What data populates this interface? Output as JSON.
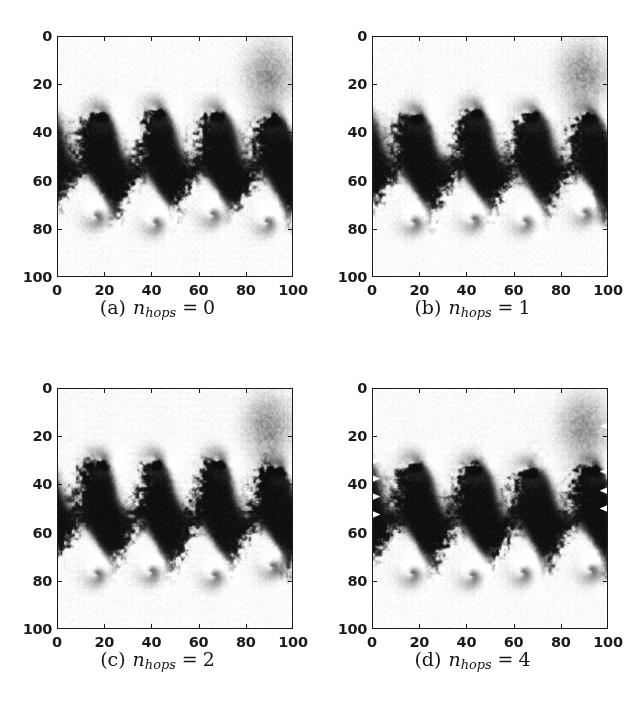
{
  "figure": {
    "type": "image-grid",
    "rows": 2,
    "cols": 2,
    "background_color": "#ffffff",
    "foreground_color": "#1a1a1a",
    "colormap": "grayscale"
  },
  "axis": {
    "x_ticks": [
      "0",
      "20",
      "40",
      "60",
      "80",
      "100"
    ],
    "y_ticks": [
      "0",
      "20",
      "40",
      "60",
      "80",
      "100"
    ],
    "x_tick_values": [
      0,
      20,
      40,
      60,
      80,
      100
    ],
    "y_tick_values": [
      0,
      20,
      40,
      60,
      80,
      100
    ],
    "xlim": [
      0,
      100
    ],
    "ylim": [
      0,
      100
    ],
    "y_inverted": true,
    "tick_direction": "in",
    "xlabel": "",
    "ylabel": ""
  },
  "panels": [
    {
      "id": "a",
      "caption_label": "(a)",
      "caption_var": "n",
      "caption_sub": "hops",
      "caption_eq": "=",
      "caption_value": "0",
      "caption_full": "(a) n_hops = 0",
      "seed": 10,
      "edge_markers": false
    },
    {
      "id": "b",
      "caption_label": "(b)",
      "caption_var": "n",
      "caption_sub": "hops",
      "caption_eq": "=",
      "caption_value": "1",
      "caption_full": "(b) n_hops = 1",
      "seed": 23,
      "edge_markers": false
    },
    {
      "id": "c",
      "caption_label": "(c)",
      "caption_var": "n",
      "caption_sub": "hops",
      "caption_eq": "=",
      "caption_value": "2",
      "caption_full": "(c) n_hops = 2",
      "seed": 41,
      "edge_markers": false
    },
    {
      "id": "d",
      "caption_label": "(d)",
      "caption_var": "n",
      "caption_sub": "hops",
      "caption_eq": "=",
      "caption_value": "4",
      "caption_full": "(d) n_hops = 4",
      "seed": 57,
      "edge_markers": true
    }
  ],
  "chart_data": {
    "type": "heatmap",
    "title": "",
    "xlabel": "",
    "ylabel": "",
    "xlim": [
      0,
      100
    ],
    "ylim": [
      0,
      100
    ],
    "grid": false,
    "legend": "none",
    "colormap": "gray",
    "value_range": [
      0,
      1
    ],
    "categories": [
      "(a) n_hops = 0",
      "(b) n_hops = 1",
      "(c) n_hops = 2",
      "(d) n_hops = 4"
    ],
    "series": [
      {
        "name": "interface_centerline_y",
        "x": [
          0,
          10,
          20,
          30,
          40,
          50,
          60,
          70,
          80,
          90,
          100
        ],
        "values": [
          50,
          48,
          44,
          47,
          52,
          44,
          47,
          52,
          46,
          44,
          50
        ]
      },
      {
        "name": "vortex_core_x",
        "values": [
          17,
          44,
          68,
          92
        ]
      },
      {
        "name": "vortex_core_upper_y",
        "values": [
          33,
          33,
          30,
          22
        ]
      },
      {
        "name": "vortex_core_lower_y",
        "values": [
          74,
          74,
          80,
          68
        ]
      }
    ]
  }
}
